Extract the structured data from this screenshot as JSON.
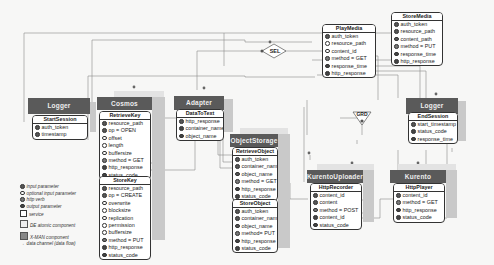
{
  "diagram": {
    "components": [
      {
        "id": "logger-start",
        "title": "Logger",
        "services": [
          {
            "name": "StartSession",
            "params": [
              {
                "type": "input",
                "label": "auth_token"
              },
              {
                "type": "input",
                "label": "timestamp"
              }
            ]
          }
        ]
      },
      {
        "id": "cosmos",
        "title": "Cosmos",
        "services": [
          {
            "name": "RetrieveKey",
            "params": [
              {
                "type": "input",
                "label": "resource_path"
              },
              {
                "type": "input",
                "label": "op = OPEN"
              },
              {
                "type": "optional",
                "label": "offset"
              },
              {
                "type": "optional",
                "label": "length"
              },
              {
                "type": "optional",
                "label": "buffersize"
              },
              {
                "type": "verb",
                "label": "method = GET"
              },
              {
                "type": "output",
                "label": "http_response"
              },
              {
                "type": "output",
                "label": "status_code"
              }
            ]
          },
          {
            "name": "StoreKey",
            "params": [
              {
                "type": "input",
                "label": "resource_path"
              },
              {
                "type": "input",
                "label": "op = CREATE"
              },
              {
                "type": "optional",
                "label": "overwrite"
              },
              {
                "type": "optional",
                "label": "blocksize"
              },
              {
                "type": "optional",
                "label": "replication"
              },
              {
                "type": "optional",
                "label": "permission"
              },
              {
                "type": "optional",
                "label": "buffersize"
              },
              {
                "type": "verb",
                "label": "method = PUT"
              },
              {
                "type": "output",
                "label": "http_response"
              },
              {
                "type": "output",
                "label": "status_code"
              }
            ]
          }
        ]
      },
      {
        "id": "adapter",
        "title": "Adapter",
        "services": [
          {
            "name": "DataToText",
            "params": [
              {
                "type": "input",
                "label": "http_response"
              },
              {
                "type": "output",
                "label": "container_name"
              },
              {
                "type": "output",
                "label": "object_name"
              }
            ]
          }
        ]
      },
      {
        "id": "objectstorage",
        "title": "ObjectStorage",
        "services": [
          {
            "name": "RetrieveObject",
            "params": [
              {
                "type": "input",
                "label": "auth_token"
              },
              {
                "type": "input",
                "label": "container_name"
              },
              {
                "type": "input",
                "label": "object_name"
              },
              {
                "type": "verb",
                "label": "method = GET"
              },
              {
                "type": "output",
                "label": "http_response"
              },
              {
                "type": "output",
                "label": "status_code"
              }
            ]
          },
          {
            "name": "StoreObject",
            "params": [
              {
                "type": "input",
                "label": "auth_token"
              },
              {
                "type": "input",
                "label": "container_name"
              },
              {
                "type": "input",
                "label": "object_name"
              },
              {
                "type": "verb",
                "label": "method= PUT"
              },
              {
                "type": "output",
                "label": "http_response"
              },
              {
                "type": "output",
                "label": "status_code"
              }
            ]
          }
        ]
      },
      {
        "id": "kurento-uploader",
        "title": "KurentoUploader",
        "services": [
          {
            "name": "HttpRecorder",
            "params": [
              {
                "type": "input",
                "label": "content_id"
              },
              {
                "type": "input",
                "label": "content"
              },
              {
                "type": "verb",
                "label": "method = POST"
              },
              {
                "type": "output",
                "label": "content_id"
              },
              {
                "type": "output",
                "label": "status_code"
              }
            ]
          }
        ]
      },
      {
        "id": "kurento",
        "title": "Kurento",
        "services": [
          {
            "name": "HttpPlayer",
            "params": [
              {
                "type": "input",
                "label": "content_id"
              },
              {
                "type": "verb",
                "label": "method = GET"
              },
              {
                "type": "output",
                "label": "http_response"
              },
              {
                "type": "output",
                "label": "status_code"
              }
            ]
          }
        ]
      },
      {
        "id": "logger-end",
        "title": "Logger",
        "services": [
          {
            "name": "EndSession",
            "params": [
              {
                "type": "input",
                "label": "start_timestamp"
              },
              {
                "type": "output",
                "label": "status_code"
              },
              {
                "type": "output",
                "label": "response_time"
              }
            ]
          }
        ]
      }
    ],
    "interfaces": [
      {
        "id": "playmedia",
        "name": "PlayMedia",
        "params": [
          {
            "type": "input",
            "label": "auth_token"
          },
          {
            "type": "optional",
            "label": "resource_path"
          },
          {
            "type": "optional",
            "label": "content_id"
          },
          {
            "type": "verb",
            "label": "method = GET"
          },
          {
            "type": "output",
            "label": "response_time"
          },
          {
            "type": "output",
            "label": "http_response"
          }
        ]
      },
      {
        "id": "storemedia",
        "name": "StoreMedia",
        "params": [
          {
            "type": "input",
            "label": "auth_token"
          },
          {
            "type": "input",
            "label": "resource_path"
          },
          {
            "type": "input",
            "label": "content_path"
          },
          {
            "type": "verb",
            "label": "method = PUT"
          },
          {
            "type": "output",
            "label": "response_time"
          },
          {
            "type": "output",
            "label": "http_response"
          }
        ]
      }
    ],
    "gates": [
      {
        "id": "sel",
        "label": "SEL"
      },
      {
        "id": "grd",
        "label": "GRD"
      }
    ],
    "legend": [
      {
        "symbol": "input",
        "label": "input parameter"
      },
      {
        "symbol": "optional",
        "label": "optional input parameter"
      },
      {
        "symbol": "verb",
        "label": "http verb"
      },
      {
        "symbol": "output",
        "label": "output parameter"
      },
      {
        "symbol": "box",
        "label": "service"
      },
      {
        "symbol": "cube",
        "label": "DE atomic component"
      },
      {
        "symbol": "cube-dark",
        "label": "X-MAN component"
      },
      {
        "symbol": "arrow",
        "label": "data channel (data flow)"
      }
    ],
    "colors": {
      "header": "#5a5a5a",
      "side": "#c9c9c9",
      "background": "#f7f7f6",
      "line": "#8a8a8a"
    }
  }
}
